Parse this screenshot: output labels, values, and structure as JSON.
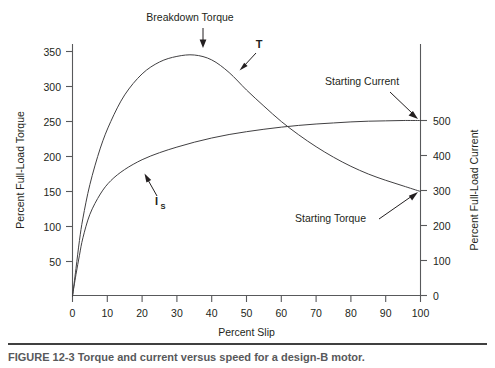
{
  "figure": {
    "caption_rule": "divider",
    "caption": "FIGURE 12-3   Torque and current versus speed for a design-B motor."
  },
  "chart_data": {
    "type": "line",
    "title": "",
    "xlabel": "Percent Slip",
    "ylabel": "Percent Full-Load Torque",
    "y2label": "Percent Full-Load Current",
    "grid": false,
    "legend": "none",
    "xlim": [
      0,
      100
    ],
    "ylim": [
      0,
      375
    ],
    "y2lim": [
      0,
      535
    ],
    "xticks": [
      0,
      10,
      20,
      30,
      40,
      50,
      60,
      70,
      80,
      90,
      100
    ],
    "yticks": [
      50,
      100,
      150,
      200,
      250,
      300,
      350
    ],
    "y2ticks": [
      0,
      100,
      200,
      300,
      400,
      500
    ],
    "series": [
      {
        "name": "T",
        "axis": "left",
        "label": "Torque",
        "x": [
          0,
          1,
          2,
          3,
          5,
          8,
          11,
          15,
          20,
          25,
          30,
          35,
          40,
          45,
          50,
          55,
          60,
          65,
          70,
          75,
          80,
          85,
          90,
          95,
          100
        ],
        "values": [
          0,
          40,
          80,
          112,
          160,
          212,
          250,
          288,
          318,
          335,
          343,
          345,
          338,
          320,
          295,
          272,
          250,
          231,
          214,
          199,
          186,
          175,
          166,
          158,
          150
        ]
      },
      {
        "name": "I_S",
        "axis": "right",
        "label": "Current",
        "x": [
          0,
          1,
          2,
          3,
          5,
          8,
          11,
          15,
          20,
          25,
          30,
          35,
          40,
          45,
          50,
          55,
          60,
          65,
          70,
          75,
          80,
          85,
          90,
          95,
          100
        ],
        "values": [
          0,
          60,
          115,
          165,
          232,
          290,
          328,
          360,
          388,
          408,
          424,
          438,
          450,
          460,
          468,
          475,
          481,
          486,
          490,
          493,
          496,
          498,
          499,
          500,
          500
        ]
      }
    ],
    "annotations": [
      {
        "id": "breakdown-torque",
        "text": "Breakdown Torque",
        "target_x": 35,
        "target_y": 345,
        "axis": "left"
      },
      {
        "id": "torque-curve-tag",
        "text": "T",
        "target_x": 45,
        "target_y": 320,
        "axis": "left"
      },
      {
        "id": "current-curve-tag",
        "text": "I",
        "subscript": "S",
        "target_x": 20,
        "target_y": 388,
        "axis": "right"
      },
      {
        "id": "starting-current",
        "text": "Starting Current",
        "target_x": 100,
        "target_y": 500,
        "axis": "right"
      },
      {
        "id": "starting-torque",
        "text": "Starting Torque",
        "target_x": 100,
        "target_y": 300,
        "axis": "right"
      }
    ]
  }
}
